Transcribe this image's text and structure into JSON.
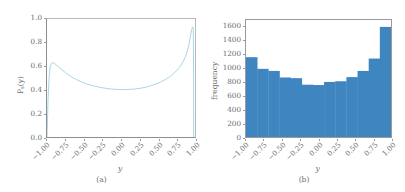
{
  "figure": {
    "panels": [
      {
        "id": "a",
        "caption": "(a)",
        "xlabel": "y",
        "ylabel_main": "P",
        "ylabel_sub": "s",
        "ylabel_arg": "(y)",
        "yticks": [
          "0.0",
          "0.2",
          "0.4",
          "0.6",
          "0.8",
          "1.0"
        ],
        "xticks": [
          "-1.00",
          "-0.75",
          "-0.50",
          "-0.25",
          "0.00",
          "0.25",
          "0.50",
          "0.75",
          "1.00"
        ]
      },
      {
        "id": "b",
        "caption": "(b)",
        "xlabel": "y",
        "ylabel": "frequency",
        "yticks": [
          "0",
          "200",
          "400",
          "600",
          "800",
          "1000",
          "1200",
          "1400",
          "1600"
        ],
        "xticks": [
          "-1.00",
          "-0.75",
          "-0.50",
          "-0.25",
          "0.00",
          "0.25",
          "0.50",
          "0.75",
          "1.00"
        ]
      }
    ],
    "colors": {
      "curve": "#9ecfe4",
      "bar_fill": "#3f86c0",
      "axis": "#8e8e8e",
      "text": "#6b6b6b",
      "background": "#ffffff"
    }
  },
  "chart_data": [
    {
      "type": "line",
      "panel": "a",
      "title": "",
      "xlabel": "y",
      "ylabel": "P_s(y)",
      "xlim": [
        -1.0,
        1.0
      ],
      "ylim": [
        0.0,
        1.0
      ],
      "xticks": [
        -1.0,
        -0.75,
        -0.5,
        -0.25,
        0.0,
        0.25,
        0.5,
        0.75,
        1.0
      ],
      "yticks": [
        0.0,
        0.2,
        0.4,
        0.6,
        0.8,
        1.0
      ],
      "grid": false,
      "legend": "none",
      "x": [
        -1.0,
        -0.985,
        -0.97,
        -0.955,
        -0.94,
        -0.92,
        -0.9,
        -0.87,
        -0.84,
        -0.8,
        -0.75,
        -0.7,
        -0.65,
        -0.6,
        -0.55,
        -0.5,
        -0.45,
        -0.4,
        -0.35,
        -0.3,
        -0.25,
        -0.2,
        -0.15,
        -0.1,
        -0.05,
        0.0,
        0.05,
        0.1,
        0.15,
        0.2,
        0.25,
        0.3,
        0.35,
        0.4,
        0.45,
        0.5,
        0.55,
        0.6,
        0.65,
        0.7,
        0.75,
        0.8,
        0.84,
        0.87,
        0.9,
        0.92,
        0.94,
        0.955,
        0.965,
        0.972,
        0.976,
        0.98,
        0.982
      ],
      "y": [
        0.0,
        0.33,
        0.52,
        0.6,
        0.625,
        0.63,
        0.625,
        0.608,
        0.592,
        0.57,
        0.545,
        0.523,
        0.503,
        0.486,
        0.471,
        0.458,
        0.447,
        0.438,
        0.43,
        0.423,
        0.417,
        0.412,
        0.408,
        0.405,
        0.403,
        0.402,
        0.402,
        0.403,
        0.405,
        0.408,
        0.412,
        0.418,
        0.425,
        0.434,
        0.444,
        0.456,
        0.47,
        0.487,
        0.507,
        0.532,
        0.562,
        0.6,
        0.64,
        0.68,
        0.735,
        0.79,
        0.86,
        0.91,
        0.93,
        0.932,
        0.91,
        0.7,
        0.0
      ]
    },
    {
      "type": "bar",
      "panel": "b",
      "title": "",
      "xlabel": "y",
      "ylabel": "frequency",
      "xlim": [
        -1.0,
        1.0
      ],
      "ylim": [
        0,
        1700
      ],
      "xticks": [
        -1.0,
        -0.75,
        -0.5,
        -0.25,
        0.0,
        0.25,
        0.5,
        0.75,
        1.0
      ],
      "yticks": [
        0,
        200,
        400,
        600,
        800,
        1000,
        1200,
        1400,
        1600
      ],
      "grid": false,
      "legend": "none",
      "bin_edges": [
        -1.0,
        -0.833,
        -0.667,
        -0.5,
        -0.333,
        -0.167,
        0.0,
        0.167,
        0.333,
        0.5,
        0.667,
        0.833,
        1.0
      ],
      "values": [
        1160,
        990,
        960,
        865,
        855,
        760,
        755,
        800,
        810,
        870,
        960,
        1140,
        1600
      ],
      "categories": [
        "-1.00 to -0.85",
        "-0.85 to -0.70",
        "-0.70 to -0.55",
        "-0.55 to -0.40",
        "-0.40 to -0.25",
        "-0.25 to -0.10",
        "-0.10 to 0.05",
        "0.05 to 0.20",
        "0.20 to 0.35",
        "0.35 to 0.50",
        "0.50 to 0.65",
        "0.65 to 0.82",
        "0.82 to 1.00"
      ]
    }
  ]
}
